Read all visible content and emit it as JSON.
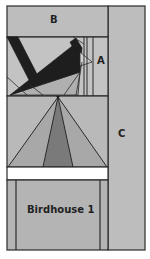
{
  "labels": {
    "b": "B",
    "a": "A",
    "c": "C",
    "birdhouse": "Birdhouse 1"
  },
  "colors": {
    "background_fill": "#b4b4b4",
    "light_fill": "#c6c6c6",
    "mid_fill": "#a6a6a6",
    "dark_fill": "#7a7a7a",
    "black_fill": "#1e1e1e",
    "white_band": "#ffffff",
    "stroke": "#2a2a2a"
  },
  "sections": [
    {
      "name": "section-b",
      "label": "B"
    },
    {
      "name": "section-a-bird",
      "label": "A"
    },
    {
      "name": "section-roof",
      "label": ""
    },
    {
      "name": "section-birdhouse-body",
      "label": "Birdhouse 1"
    },
    {
      "name": "section-c",
      "label": "C"
    }
  ]
}
